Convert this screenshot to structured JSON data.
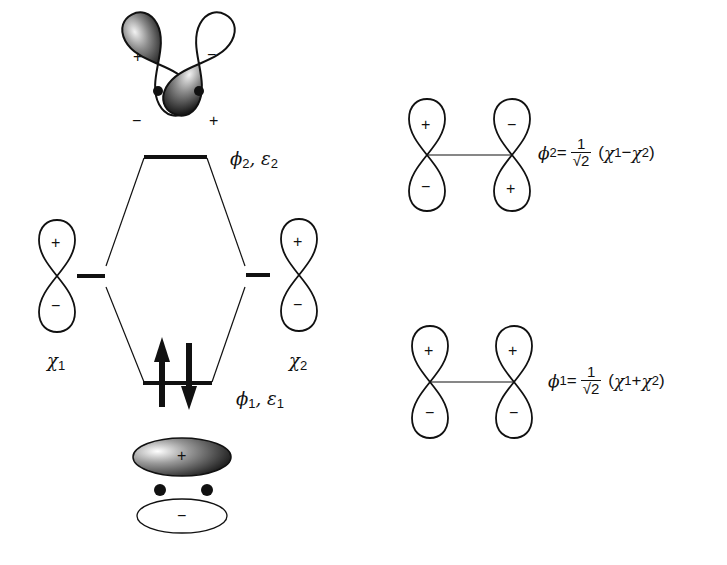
{
  "figure": {
    "levels": {
      "antibonding": {
        "label_symbol": "ϕ",
        "label_sub": "2",
        "energy_symbol": "ε",
        "energy_sub": "2"
      },
      "bonding": {
        "label_symbol": "ϕ",
        "label_sub": "1",
        "energy_symbol": "ε",
        "energy_sub": "1",
        "electrons": "↑↓"
      },
      "ao_left": {
        "symbol": "χ",
        "sub": "1"
      },
      "ao_right": {
        "symbol": "χ",
        "sub": "2"
      }
    },
    "signs": {
      "plus": "+",
      "minus": "−"
    },
    "equations": {
      "phi2": {
        "lhs": "ϕ",
        "lhs_sub": "2",
        "eq": "=",
        "num": "1",
        "den": "√2",
        "open": "(",
        "a": "χ",
        "a_sub": "1",
        "op": "−",
        "b": "χ",
        "b_sub": "2",
        "close": ")"
      },
      "phi1": {
        "lhs": "ϕ",
        "lhs_sub": "1",
        "eq": "=",
        "num": "1",
        "den": "√2",
        "open": "(",
        "a": "χ",
        "a_sub": "1",
        "op": "+",
        "b": "χ",
        "b_sub": "2",
        "close": ")"
      }
    },
    "colors": {
      "ink": "#111111",
      "shade_dark": "#2a2a2a",
      "shade_light": "#e8e8e8"
    }
  }
}
